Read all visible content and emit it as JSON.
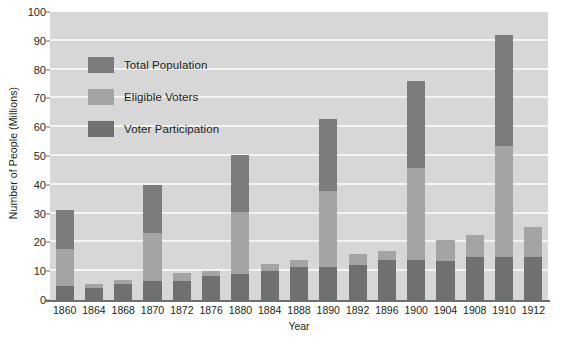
{
  "chart_data": {
    "type": "bar",
    "title": "",
    "xlabel": "Year",
    "ylabel": "Number of People (Millions)",
    "ylim": [
      0,
      100
    ],
    "ytick_step": 10,
    "yticks": [
      0,
      10,
      20,
      30,
      40,
      50,
      60,
      70,
      80,
      90,
      100
    ],
    "grid": true,
    "grid_axis": "y",
    "legend_position": "upper-left-inside",
    "stacked": true,
    "categories": [
      "1860",
      "1864",
      "1868",
      "1870",
      "1872",
      "1876",
      "1880",
      "1884",
      "1888",
      "1890",
      "1892",
      "1896",
      "1900",
      "1904",
      "1908",
      "1910",
      "1912"
    ],
    "series": [
      {
        "name": "Total Population",
        "color": "#7c7c7c",
        "values": [
          31.4,
          5.5,
          7.0,
          40.0,
          9.5,
          10.0,
          50.5,
          12.5,
          14.0,
          63.0,
          16.0,
          17.0,
          76.0,
          21.0,
          22.5,
          92.0,
          25.5
        ]
      },
      {
        "name": "Eligible Voters",
        "color": "#a3a4a3",
        "values": [
          31.4,
          5.5,
          7.0,
          40.0,
          9.5,
          10.0,
          50.5,
          12.5,
          14.0,
          63.0,
          16.0,
          17.0,
          76.0,
          21.0,
          22.5,
          92.0,
          25.5
        ]
      },
      {
        "name": "Voter Participation",
        "color": "#6f7072",
        "values": [
          4.7,
          4.0,
          5.7,
          6.5,
          6.5,
          8.4,
          9.2,
          10.0,
          11.4,
          11.4,
          12.1,
          13.9,
          13.9,
          13.5,
          14.9,
          15.0,
          15.0
        ]
      }
    ]
  },
  "legend": {
    "items": [
      {
        "label": "Total Population",
        "color": "#7c7c7c"
      },
      {
        "label": "Eligible Voters",
        "color": "#a3a4a3"
      },
      {
        "label": "Voter Participation",
        "color": "#6f7072"
      }
    ]
  },
  "axes": {
    "y_title": "Number of People (Millions)",
    "x_title": "Year"
  },
  "colors": {
    "plot_background": "#d6d7d6",
    "gridline": "#f4f4f4",
    "axis_line": "#6d6e71",
    "text": "#231f20",
    "page_background": "#ffffff"
  }
}
